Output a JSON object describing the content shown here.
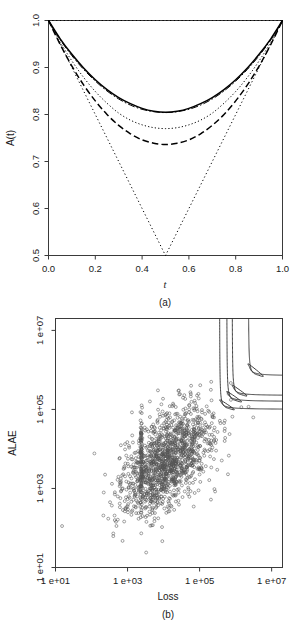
{
  "figure": {
    "panels": [
      {
        "id": "a",
        "caption": "(a)",
        "xlabel": "t",
        "ylabel": "A(t)"
      },
      {
        "id": "b",
        "caption": "(b)",
        "xlabel": "Loss",
        "ylabel": "ALAE"
      }
    ]
  },
  "chart_data": [
    {
      "type": "line",
      "panel": "(a)",
      "title": "",
      "xlabel": "t",
      "ylabel": "A(t)",
      "xlim": [
        0.0,
        1.0
      ],
      "ylim": [
        0.5,
        1.0
      ],
      "xticks": [
        "0.0",
        "0.2",
        "0.4",
        "0.6",
        "0.8",
        "1.0"
      ],
      "xtick_values": [
        0.0,
        0.2,
        0.4,
        0.6,
        0.8,
        1.0
      ],
      "yticks": [
        "0.5",
        "0.6",
        "0.7",
        "0.8",
        "0.9",
        "1.0"
      ],
      "ytick_values": [
        0.5,
        0.6,
        0.7,
        0.8,
        0.9,
        1.0
      ],
      "grid": false,
      "legend": "none",
      "x": [
        0.0,
        0.05,
        0.1,
        0.15,
        0.2,
        0.25,
        0.3,
        0.35,
        0.4,
        0.45,
        0.5,
        0.55,
        0.6,
        0.65,
        0.7,
        0.75,
        0.8,
        0.85,
        0.9,
        0.95,
        1.0
      ],
      "series": [
        {
          "name": "independence-bound",
          "style": "dotted",
          "values": [
            1.0,
            1.0,
            1.0,
            1.0,
            1.0,
            1.0,
            1.0,
            1.0,
            1.0,
            1.0,
            1.0,
            1.0,
            1.0,
            1.0,
            1.0,
            1.0,
            1.0,
            1.0,
            1.0,
            1.0,
            1.0
          ]
        },
        {
          "name": "comonotonicity-bound",
          "style": "dotted",
          "values": [
            1.0,
            0.95,
            0.9,
            0.85,
            0.8,
            0.75,
            0.7,
            0.65,
            0.6,
            0.55,
            0.5,
            0.55,
            0.6,
            0.65,
            0.7,
            0.75,
            0.8,
            0.85,
            0.9,
            0.95,
            1.0
          ]
        },
        {
          "name": "parametric-estimate-solid",
          "style": "solid",
          "values": [
            1.0,
            0.961,
            0.928,
            0.899,
            0.874,
            0.853,
            0.836,
            0.823,
            0.813,
            0.807,
            0.805,
            0.807,
            0.813,
            0.823,
            0.836,
            0.853,
            0.874,
            0.899,
            0.928,
            0.961,
            1.0
          ]
        },
        {
          "name": "nonparametric-estimate-dashdot",
          "style": "dashdot",
          "values": [
            1.0,
            0.959,
            0.925,
            0.896,
            0.871,
            0.85,
            0.833,
            0.82,
            0.811,
            0.806,
            0.804,
            0.806,
            0.811,
            0.82,
            0.833,
            0.85,
            0.871,
            0.896,
            0.925,
            0.959,
            1.0
          ]
        },
        {
          "name": "estimate-fine-dotted",
          "style": "dotted-fine",
          "values": [
            1.0,
            0.954,
            0.914,
            0.879,
            0.849,
            0.824,
            0.803,
            0.788,
            0.778,
            0.772,
            0.77,
            0.772,
            0.778,
            0.788,
            0.803,
            0.824,
            0.849,
            0.879,
            0.914,
            0.954,
            1.0
          ]
        },
        {
          "name": "estimate-long-dashed",
          "style": "dashed",
          "values": [
            1.0,
            0.949,
            0.903,
            0.863,
            0.829,
            0.8,
            0.777,
            0.759,
            0.746,
            0.739,
            0.736,
            0.739,
            0.746,
            0.759,
            0.777,
            0.8,
            0.829,
            0.863,
            0.903,
            0.949,
            1.0
          ]
        }
      ]
    },
    {
      "type": "scatter",
      "panel": "(b)",
      "title": "",
      "xlabel": "Loss",
      "ylabel": "ALAE",
      "xscale": "log",
      "yscale": "log",
      "xlim": [
        10,
        20000000
      ],
      "ylim": [
        10,
        20000000
      ],
      "xticks": [
        "1 e+01",
        "1 e+03",
        "1 e+05",
        "1 e+07"
      ],
      "xtick_values": [
        10,
        1000,
        100000,
        10000000
      ],
      "yticks": [
        "1 e+01",
        "1 e+03",
        "1 e+05",
        "1 e+07"
      ],
      "ytick_values": [
        10,
        1000,
        100000,
        10000000
      ],
      "grid": false,
      "legend": "none",
      "marker": "open-circle",
      "n_points": 1500,
      "point_cloud_center_log10": [
        4.1,
        3.7
      ],
      "annotations": "four nested L-shaped joint-survival quantile contour curves in upper-right corner",
      "contours": [
        {
          "name": "contour-1",
          "x_asymptote_log10": 5.55,
          "y_asymptote_log10": 5.0
        },
        {
          "name": "contour-2",
          "x_asymptote_log10": 5.75,
          "y_asymptote_log10": 5.2
        },
        {
          "name": "contour-3",
          "x_asymptote_log10": 5.9,
          "y_asymptote_log10": 5.35
        },
        {
          "name": "contour-4",
          "x_asymptote_log10": 6.35,
          "y_asymptote_log10": 5.85
        }
      ]
    }
  ]
}
